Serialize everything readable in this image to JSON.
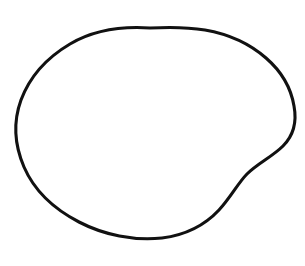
{
  "figure": {
    "stage_label": "metaphase",
    "style": "black and white stippled line drawing",
    "canvas": {
      "width": 305,
      "height": 266
    },
    "background_color": "#ffffff",
    "ink_color": "#111111",
    "stipple_color": "#4a4a4a"
  },
  "structures": {
    "cell_membrane": {
      "name": "cell membrane",
      "description": "thick irregular closed outline with a concave notch on the lower right",
      "stroke_color": "#111111",
      "stroke_width": 3.1,
      "path": "M 150 28 C 120 26 92 31 70 44 C 48 57 30 76 21 100 C 13 122 15 146 24 167 C 34 190 54 209 79 222 C 104 235 134 241 162 238 C 186 235 205 225 219 210 C 231 197 238 183 247 174 C 258 163 272 157 283 146 C 293 136 297 122 294 106 C 291 88 281 71 266 58 C 250 44 228 34 205 30 C 187 27 168 27 150 28 Z"
    },
    "cytoplasm": {
      "name": "cytoplasm",
      "description": "interior filled with fine even stipple dots",
      "fill_color": "#fdfdfd",
      "stipple_dot_count": 1500
    },
    "metaphase_plate": {
      "name": "metaphase plate",
      "description": "dense irregular band of chromosomes aligned at the cell equator, tilted slightly upward to the right",
      "fill_color": "#080808",
      "left_end": {
        "x": 40,
        "y": 152
      },
      "right_end": {
        "x": 250,
        "y": 128
      },
      "tilt_degrees": -7,
      "blob_count": 62,
      "band_path": "M 40 154 L 52 146 L 66 152 L 80 144 L 94 150 L 108 143 L 122 149 L 136 142 L 150 147 L 164 140 L 178 145 L 192 138 L 206 143 L 220 135 L 234 140 L 248 130 L 250 136 L 236 146 L 222 141 L 208 150 L 194 145 L 180 152 L 166 147 L 152 154 L 138 149 L 124 156 L 110 150 L 96 157 L 82 151 L 68 159 L 54 153 L 40 160 Z"
    },
    "spindle_apparatus": {
      "name": "spindle apparatus",
      "description": "two fans of fine spindle fibers radiating from the poles to the metaphase plate",
      "fiber_count_top": 14,
      "fiber_count_bottom": 13,
      "fiber_color": "#1a1a1a"
    },
    "top_pole": {
      "name": "upper spindle pole",
      "description": "pair of dark centrioles at the top of the spindle",
      "position": {
        "x": 160,
        "y": 60
      },
      "centrioles": [
        {
          "name": "centriole",
          "x": 152,
          "y": 60,
          "rx": 7,
          "ry": 5.5
        },
        {
          "name": "centriole",
          "x": 170,
          "y": 60,
          "rx": 7,
          "ry": 5.5
        }
      ]
    },
    "bottom_pole": {
      "name": "lower spindle pole",
      "description": "pair of small star-shaped centrioles at the bottom of the spindle",
      "position": {
        "x": 128,
        "y": 216
      },
      "centrioles": [
        {
          "name": "centriole",
          "x": 119,
          "y": 217,
          "rx": 5.5,
          "ry": 4.5
        },
        {
          "name": "centriole",
          "x": 139,
          "y": 215,
          "rx": 6,
          "ry": 5
        }
      ]
    }
  },
  "fibers": {
    "top": [
      {
        "d": "M 150 66 C 132 86 108 112 88 134"
      },
      {
        "d": "M 152 66 C 138 90 118 116 100 139"
      },
      {
        "d": "M 154 66 C 144 92 130 120 116 143"
      },
      {
        "d": "M 157 67 C 151 94 143 122 135 146"
      },
      {
        "d": "M 160 67 C 158 95 156 124 153 148"
      },
      {
        "d": "M 163 67 C 166 95 169 122 172 144"
      },
      {
        "d": "M 167 67 C 174 93 182 119 190 141"
      },
      {
        "d": "M 170 66 C 182 90 196 115 208 137"
      },
      {
        "d": "M 173 66 C 189 88 207 112 223 133"
      },
      {
        "d": "M 175 65 C 195 85 218 108 238 128"
      },
      {
        "d": "M 148 66 C 126 84 100 108 78 130"
      },
      {
        "d": "M 146 65 C 120 82 92 104 68 126"
      },
      {
        "d": "M 165 67 C 170 94 176 122 181 146"
      },
      {
        "d": "M 158 67 C 154 95 150 123 146 147"
      }
    ],
    "bottom": [
      {
        "d": "M 124 210 C 110 194 92 178 74 164"
      },
      {
        "d": "M 125 210 C 114 193 100 176 86 162"
      },
      {
        "d": "M 127 210 C 119 192 110 175 100 160"
      },
      {
        "d": "M 129 210 C 124 192 119 174 114 158"
      },
      {
        "d": "M 131 209 C 130 191 129 173 128 157"
      },
      {
        "d": "M 134 209 C 137 191 141 173 145 156"
      },
      {
        "d": "M 137 208 C 144 190 153 172 162 155"
      },
      {
        "d": "M 140 208 C 151 190 164 171 178 153"
      },
      {
        "d": "M 142 207 C 157 189 175 169 193 151"
      },
      {
        "d": "M 144 207 C 163 188 185 167 207 149"
      },
      {
        "d": "M 122 211 C 105 196 85 182 64 170"
      },
      {
        "d": "M 133 209 C 134 191 135 173 136 156"
      },
      {
        "d": "M 139 208 C 148 190 158 172 169 154"
      }
    ]
  }
}
